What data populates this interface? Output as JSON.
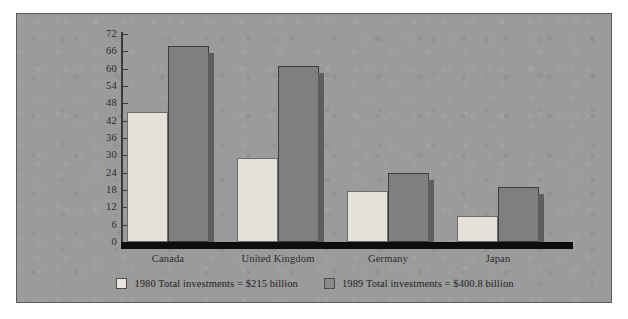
{
  "chart_data": {
    "type": "bar",
    "title": "",
    "subtitle": "",
    "xlabel": "",
    "ylabel": "",
    "ylim": [
      0,
      72
    ],
    "yticks": [
      0,
      6,
      12,
      18,
      24,
      30,
      36,
      42,
      48,
      54,
      60,
      66,
      72
    ],
    "grid": false,
    "legend_position": "bottom-center",
    "categories": [
      "Canada",
      "United Kingdom",
      "Germany",
      "Japan"
    ],
    "series": [
      {
        "name": "1980 Total investments = $215 billion",
        "short_name": "1980",
        "color": "#e3e1d8",
        "values": [
          45,
          29,
          17.5,
          9
        ]
      },
      {
        "name": "1989 Total investments = $400.8 billion",
        "short_name": "1989",
        "color": "#7f7f7f",
        "values": [
          68,
          61,
          24,
          19
        ]
      }
    ],
    "annotations": []
  },
  "legend": {
    "items": [
      {
        "swatch": "swatch-1980",
        "label": "1980 Total investments = $215 billion"
      },
      {
        "swatch": "swatch-1989",
        "label": "1989 Total investments = $400.8 billion"
      }
    ]
  },
  "colors": {
    "panel_background": "#9b9b9b",
    "panel_border": "#5c5c5c",
    "bar_1980": "#e3e1d8",
    "bar_1989": "#7f7f7f",
    "bar_shadow": "#5e5e5e",
    "axis": "#3a3a3a",
    "baseline": "#0d0d0d",
    "text": "#2b2b2b"
  }
}
